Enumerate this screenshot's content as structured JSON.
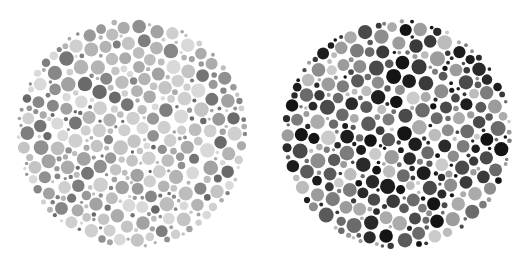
{
  "figure": {
    "type": "pseudoisochromatic-plate-pair",
    "background_color": "#ffffff",
    "canvas": {
      "width": 521,
      "height": 267
    },
    "plate_count": 2
  },
  "plates": [
    {
      "id": "plate-left",
      "name": "left-ishihara-plate",
      "label": "Left plate",
      "contrast": "low",
      "center": {
        "x": 132,
        "y": 133
      },
      "radius": 116,
      "bounds": {
        "x_min": 16,
        "x_max": 248,
        "y_min": 17,
        "y_max": 249
      },
      "dot_count": 660,
      "dot_radius_min": 1.6,
      "dot_radius_max": 7.4,
      "gap": 0.9,
      "seed": 20314,
      "palette": [
        "#d9d9d9",
        "#cfcfcf",
        "#c4c4c4",
        "#bdbdbd",
        "#b4b4b4",
        "#ababab",
        "#a2a2a2",
        "#999999",
        "#909090",
        "#878787",
        "#7e7e7e",
        "#757575"
      ],
      "palette_weights": [
        10,
        11,
        10,
        9,
        9,
        9,
        9,
        8,
        8,
        7,
        6,
        4
      ],
      "dark_accent_color": "#6a6a6a",
      "dark_accent_fraction": 0.07
    },
    {
      "id": "plate-right",
      "name": "right-ishihara-plate",
      "label": "Right plate",
      "contrast": "high",
      "center": {
        "x": 397,
        "y": 134
      },
      "radius": 116,
      "bounds": {
        "x_min": 281,
        "x_max": 513,
        "y_min": 18,
        "y_max": 250
      },
      "dot_count": 640,
      "dot_radius_min": 1.7,
      "dot_radius_max": 7.6,
      "gap": 0.9,
      "seed": 77129,
      "palette": [
        "#1d1d1d",
        "#2a2a2a",
        "#3a3a3a",
        "#4a4a4a",
        "#5a5a5a",
        "#6b6b6b",
        "#7c7c7c",
        "#8d8d8d",
        "#9c9c9c",
        "#ababab",
        "#bcbcbc",
        "#cbcbcb"
      ],
      "palette_weights": [
        8,
        9,
        9,
        8,
        8,
        9,
        10,
        10,
        9,
        8,
        7,
        5
      ],
      "dark_accent_color": "#141414",
      "dark_accent_fraction": 0.1
    }
  ],
  "chart_data": {
    "type": "scatter",
    "subtitle": "Two circular pseudoisochromatic dot mosaics side by side",
    "xlabel": "",
    "ylabel": "",
    "grid": false,
    "legend": false,
    "legend_position": "none",
    "xlim": [
      0,
      521
    ],
    "ylim": [
      0,
      267
    ],
    "background": "#ffffff",
    "series": [
      {
        "name": "Left plate (low contrast)",
        "marker": "circle",
        "center_x": 132,
        "center_y": 133,
        "radius": 116,
        "n_points": 660,
        "marker_size_range": [
          3.2,
          14.8
        ],
        "value_range_gray": [
          117,
          217
        ],
        "mean_gray": 172,
        "color_low": "#757575",
        "color_high": "#d9d9d9"
      },
      {
        "name": "Right plate (high contrast)",
        "marker": "circle",
        "center_x": 397,
        "center_y": 134,
        "radius": 116,
        "n_points": 640,
        "marker_size_range": [
          3.4,
          15.2
        ],
        "value_range_gray": [
          20,
          203
        ],
        "mean_gray": 118,
        "color_low": "#141414",
        "color_high": "#cbcbcb"
      }
    ]
  }
}
